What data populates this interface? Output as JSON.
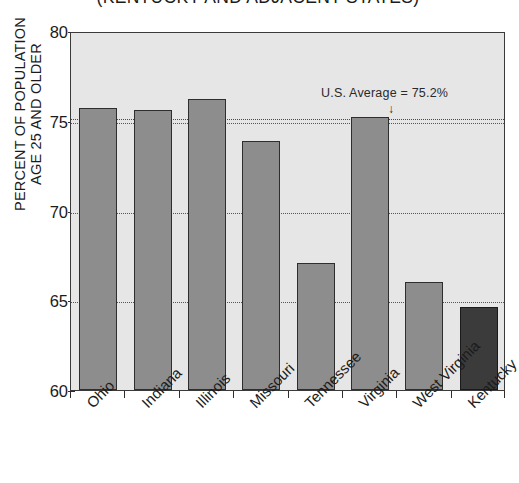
{
  "chart_data": {
    "type": "bar",
    "title": "(KENTUCKY AND ADJACENT STATES)",
    "xlabel": "",
    "ylabel_line1": "PERCENT OF POPULATION",
    "ylabel_line2": "AGE 25 AND OLDER",
    "categories": [
      "Ohio",
      "Indiana",
      "Illinois",
      "Missouri",
      "Tennessee",
      "Virginia",
      "West Virginia",
      "Kentucky"
    ],
    "values": [
      75.7,
      75.6,
      76.2,
      73.9,
      67.1,
      75.2,
      66.0,
      64.6
    ],
    "ylim": [
      60,
      80
    ],
    "yticks": [
      60,
      65,
      70,
      75,
      80
    ],
    "ytick_labels": [
      "60",
      "65",
      "70",
      "75",
      "80"
    ],
    "gridlines": [
      65,
      70,
      75
    ],
    "grid": true,
    "legend": "none",
    "annotations": [
      {
        "text": "U.S. Average = 75.2%",
        "value": 75.2,
        "arrow": "↓"
      }
    ],
    "colors": {
      "bar": "#8d8d8d",
      "bar_highlight": "#3b3b3b",
      "bar_edge": "#2e2e2e",
      "plot_background": "#e6e6e6",
      "axis": "#3a3a3a",
      "text": "#1b1b1b",
      "gridline": "#555555"
    },
    "highlight_category": "Kentucky"
  }
}
